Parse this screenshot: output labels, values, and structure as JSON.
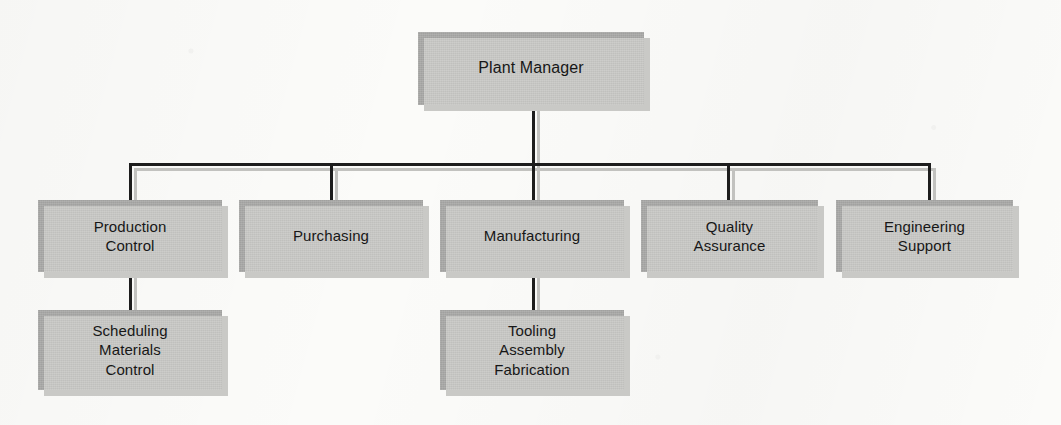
{
  "chart": {
    "type": "org-chart",
    "style": {
      "box_fill": "#a9a9a7",
      "box_shadow": "#c9c9c6",
      "line_color": "#1d1d1d",
      "line_shadow": "#c2c2bf",
      "background": "#fbfbf9",
      "text_color": "#171717"
    },
    "levels": [
      {
        "level": 1,
        "nodes": [
          {
            "id": "plant-manager",
            "label": "Plant Manager",
            "x": 418,
            "y": 32,
            "w": 226,
            "h": 73,
            "parent": null
          }
        ]
      },
      {
        "level": 2,
        "nodes": [
          {
            "id": "production-control",
            "label": "Production\nControl",
            "x": 38,
            "y": 200,
            "w": 184,
            "h": 72,
            "parent": "plant-manager"
          },
          {
            "id": "purchasing",
            "label": "Purchasing",
            "x": 239,
            "y": 200,
            "w": 184,
            "h": 72,
            "parent": "plant-manager"
          },
          {
            "id": "manufacturing",
            "label": "Manufacturing",
            "x": 440,
            "y": 200,
            "w": 184,
            "h": 72,
            "parent": "plant-manager"
          },
          {
            "id": "quality-assurance",
            "label": "Quality\nAssurance",
            "x": 641,
            "y": 200,
            "w": 177,
            "h": 72,
            "parent": "plant-manager"
          },
          {
            "id": "engineering-support",
            "label": "Engineering\nSupport",
            "x": 836,
            "y": 200,
            "w": 177,
            "h": 72,
            "parent": "plant-manager"
          }
        ]
      },
      {
        "level": 3,
        "nodes": [
          {
            "id": "scheduling-materials-control",
            "label": "Scheduling\nMaterials\nControl",
            "x": 38,
            "y": 310,
            "w": 184,
            "h": 80,
            "parent": "production-control"
          },
          {
            "id": "tooling-assembly-fabrication",
            "label": "Tooling\nAssembly\nFabrication",
            "x": 440,
            "y": 310,
            "w": 184,
            "h": 80,
            "parent": "manufacturing"
          }
        ]
      }
    ],
    "connectors": {
      "bus_y": 163,
      "bus_left_x": 129,
      "bus_right_x": 928,
      "drop_x_positions": [
        129,
        330,
        532,
        727,
        928
      ],
      "root_stem": {
        "x": 532,
        "from_y": 105,
        "to_y": 163
      },
      "child_stems": [
        {
          "id": "production-control-to-child",
          "x": 129,
          "from_y": 272,
          "to_y": 310
        },
        {
          "id": "manufacturing-to-child",
          "x": 532,
          "from_y": 272,
          "to_y": 310
        }
      ]
    }
  }
}
